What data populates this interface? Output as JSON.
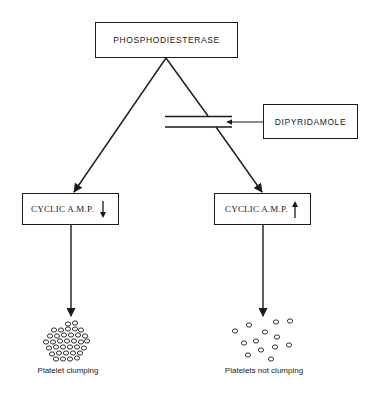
{
  "diagram": {
    "nodes": {
      "enzyme": {
        "label": "PHOSPHODIESTERASE"
      },
      "inhibitor": {
        "label": "DIPYRIDAMOLE"
      },
      "camp_low": {
        "label": "CYCLIC A.M.P.",
        "trend": "down",
        "trend_icon": "arrow-down-icon"
      },
      "camp_high": {
        "label": "CYCLIC A.M.P.",
        "trend": "up",
        "trend_icon": "arrow-up-icon"
      }
    },
    "outcomes": {
      "left": {
        "label": "Platelet clumping",
        "icon": "clustered-platelets"
      },
      "right": {
        "label": "Platelets not clumping",
        "icon": "scattered-platelets"
      }
    },
    "edges": [
      {
        "from": "PHOSPHODIESTERASE",
        "to": "CYCLIC A.M.P. (down)"
      },
      {
        "from": "PHOSPHODIESTERASE",
        "to": "CYCLIC A.M.P. (up)",
        "blocked_by": "DIPYRIDAMOLE"
      },
      {
        "from": "DIPYRIDAMOLE",
        "to": "barrier"
      },
      {
        "from": "CYCLIC A.M.P. (down)",
        "to": "Platelet clumping"
      },
      {
        "from": "CYCLIC A.M.P. (up)",
        "to": "Platelets not clumping"
      }
    ],
    "colors": {
      "ink": "#1a1a1a",
      "background": "#ffffff"
    }
  }
}
